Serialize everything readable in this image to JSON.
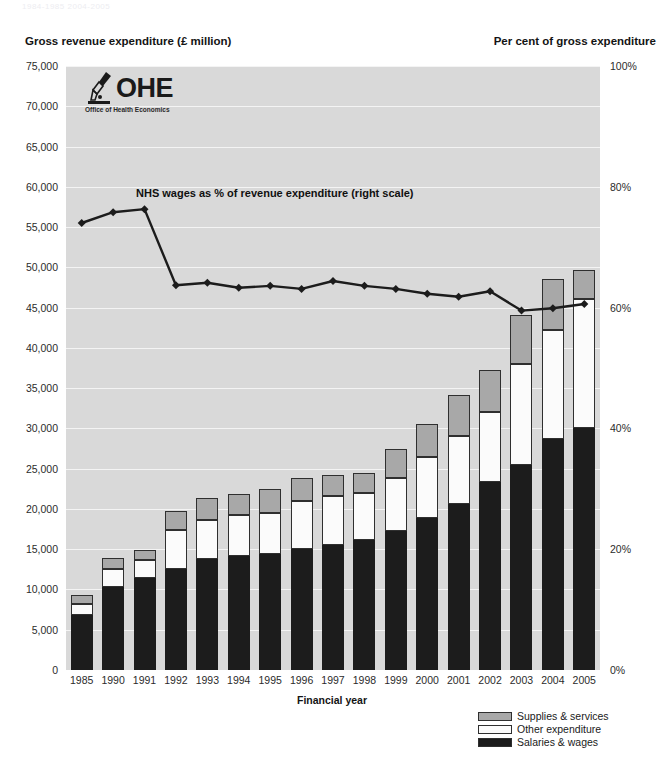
{
  "running_header": "1984-1985   2004-2005",
  "left_axis_title": "Gross revenue expenditure (£ million)",
  "right_axis_title": "Per cent of gross expenditure",
  "logo": {
    "name": "OHE",
    "subtitle": "Office of Health Economics"
  },
  "legend": {
    "items": [
      {
        "label": "Supplies & services",
        "color": "#a8a8a8"
      },
      {
        "label": "Other expenditure",
        "color": "#fbfbfb"
      },
      {
        "label": "Salaries & wages",
        "color": "#1c1c1c"
      }
    ]
  },
  "chart_data": {
    "type": "bar",
    "title": "",
    "xlabel": "Financial year",
    "ylabel": "Gross revenue expenditure (£ million)",
    "y2label": "Per cent of gross expenditure",
    "ylim": [
      0,
      75000
    ],
    "y2lim": [
      0,
      100
    ],
    "yticks": [
      0,
      5000,
      10000,
      15000,
      20000,
      25000,
      30000,
      35000,
      40000,
      45000,
      50000,
      55000,
      60000,
      65000,
      70000,
      75000
    ],
    "ytick_labels": [
      "0",
      "5,000",
      "10,000",
      "15,000",
      "20,000",
      "25,000",
      "30,000",
      "35,000",
      "40,000",
      "45,000",
      "50,000",
      "55,000",
      "60,000",
      "65,000",
      "70,000",
      "75,000"
    ],
    "y2ticks": [
      0,
      20,
      40,
      60,
      80,
      100
    ],
    "y2tick_labels": [
      "0%",
      "20%",
      "40%",
      "60%",
      "80%",
      "100%"
    ],
    "grid": true,
    "legend_position": "bottom-right",
    "stacked": true,
    "categories": [
      "1985",
      "1990",
      "1991",
      "1992",
      "1993",
      "1994",
      "1995",
      "1996",
      "1997",
      "1998",
      "1999",
      "2000",
      "2001",
      "2002",
      "2003",
      "2004",
      "2005"
    ],
    "series": [
      {
        "name": "Salaries & wages",
        "color": "#1c1c1c",
        "values": [
          6800,
          10300,
          11400,
          12500,
          13800,
          14200,
          14400,
          15000,
          15500,
          16100,
          17200,
          18900,
          20600,
          23300,
          25500,
          28700,
          30100
        ]
      },
      {
        "name": "Other expenditure",
        "color": "#fbfbfb",
        "values": [
          1400,
          2300,
          2200,
          4900,
          4800,
          5000,
          5100,
          6000,
          6100,
          5900,
          6600,
          7500,
          8500,
          8700,
          12500,
          13500,
          16000
        ]
      },
      {
        "name": "Supplies & services",
        "color": "#a8a8a8",
        "values": [
          1100,
          1300,
          1300,
          2400,
          2700,
          2600,
          3000,
          2900,
          2600,
          2500,
          3600,
          4200,
          5000,
          5300,
          6100,
          6300,
          3600
        ]
      }
    ],
    "totals": [
      9300,
      13900,
      14900,
      19800,
      21300,
      21800,
      22500,
      23900,
      24200,
      24500,
      27400,
      30600,
      34100,
      37300,
      44100,
      48500,
      49700
    ],
    "line_series": {
      "name": "NHS wages as % of revenue expenditure (right scale)",
      "axis": "right",
      "color": "#1c1c1c",
      "marker": "diamond",
      "values": [
        74.0,
        75.8,
        76.3,
        63.7,
        64.1,
        63.3,
        63.6,
        63.1,
        64.4,
        63.6,
        63.1,
        62.3,
        61.8,
        62.7,
        59.5,
        59.9,
        60.6
      ]
    },
    "annotations": [
      {
        "text": "NHS wages as % of revenue expenditure (right scale)",
        "x": "1991",
        "y": 80
      }
    ]
  }
}
